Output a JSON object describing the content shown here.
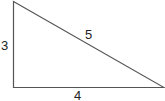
{
  "diagram": {
    "type": "right-triangle",
    "stroke_color": "#555555",
    "label_color": "#222222",
    "sides": {
      "vertical": "3",
      "hypotenuse": "5",
      "horizontal": "4"
    }
  }
}
